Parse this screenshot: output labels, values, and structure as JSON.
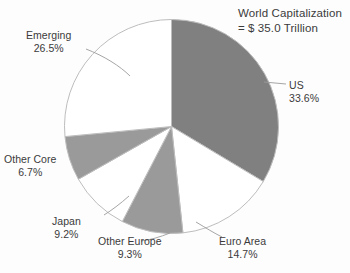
{
  "chart_data": {
    "type": "pie",
    "title": "World Capitalization",
    "subtitle": "= $ 35.0 Trillion",
    "xlabel": "",
    "ylabel": "",
    "legend_position": "none",
    "grid": false,
    "units": "percent",
    "total_label": "= $ 35.0 Trillion",
    "total_value": 35.0,
    "total_units": "Trillion USD",
    "categories": [
      "US",
      "Euro Area",
      "Other Europe",
      "Japan",
      "Other Core",
      "Emerging"
    ],
    "values": [
      33.6,
      14.7,
      9.3,
      9.2,
      6.7,
      26.5
    ],
    "slices": [
      {
        "name": "US",
        "value": 33.6,
        "value_label": "33.6%",
        "fill": "#808080",
        "start_deg": 0,
        "end_deg": 120.96
      },
      {
        "name": "Euro Area",
        "value": 14.7,
        "value_label": "14.7%",
        "fill": "#ffffff",
        "start_deg": 120.96,
        "end_deg": 173.88
      },
      {
        "name": "Other Europe",
        "value": 9.3,
        "value_label": "9.3%",
        "fill": "#9a9a9a",
        "start_deg": 173.88,
        "end_deg": 207.36
      },
      {
        "name": "Japan",
        "value": 9.2,
        "value_label": "9.2%",
        "fill": "#ffffff",
        "start_deg": 207.36,
        "end_deg": 240.48
      },
      {
        "name": "Other Core",
        "value": 6.7,
        "value_label": "6.7%",
        "fill": "#9a9a9a",
        "start_deg": 240.48,
        "end_deg": 264.6
      },
      {
        "name": "Emerging",
        "value": 26.5,
        "value_label": "26.5%",
        "fill": "#ffffff",
        "start_deg": 264.6,
        "end_deg": 360.0
      }
    ],
    "colors": {
      "gray_fill": "#808080",
      "light_gray_fill": "#9a9a9a",
      "white_fill": "#ffffff",
      "outline": "#bdbdbd",
      "leader_line": "#9b9b9b",
      "text": "#3b3b3b",
      "background": "#fdfdfd"
    }
  },
  "title": {
    "line1": "World Capitalization",
    "line2": "= $ 35.0 Trillion"
  },
  "labels": {
    "emerging": {
      "name": "Emerging",
      "value": "26.5%"
    },
    "us": {
      "name": "US",
      "value": "33.6%"
    },
    "other_core": {
      "name": "Other Core",
      "value": "6.7%"
    },
    "japan": {
      "name": "Japan",
      "value": "9.2%"
    },
    "other_europe": {
      "name": "Other Europe",
      "value": "9.3%"
    },
    "euro_area": {
      "name": "Euro Area",
      "value": "14.7%"
    }
  }
}
